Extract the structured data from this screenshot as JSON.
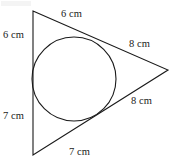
{
  "figure": {
    "kind": "geometry-diagram",
    "stroke_color": "#1a1a1a",
    "fill_color": "#ffffff",
    "background_color": "#ffffff",
    "canvas": {
      "width": 175,
      "height": 164
    },
    "triangle": {
      "vertices": [
        {
          "name": "top-vertex",
          "x": 33,
          "y": 11
        },
        {
          "name": "right-vertex",
          "x": 168,
          "y": 70
        },
        {
          "name": "bottom-vertex",
          "x": 33,
          "y": 155
        }
      ]
    },
    "incircle": {
      "center_x": 74,
      "center_y": 79,
      "radius": 42
    },
    "labels": [
      {
        "id": "top-segment",
        "text": "6 cm"
      },
      {
        "id": "upper-left-segment",
        "text": "6 cm"
      },
      {
        "id": "lower-left-segment",
        "text": "7 cm"
      },
      {
        "id": "upper-right-segment",
        "text": "8 cm"
      },
      {
        "id": "lower-right-segment",
        "text": "8 cm"
      },
      {
        "id": "bottom-segment",
        "text": "7 cm"
      }
    ]
  }
}
